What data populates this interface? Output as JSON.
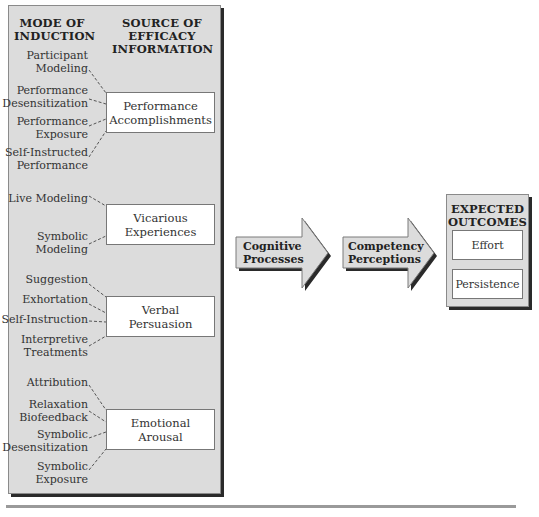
{
  "headers": {
    "mode": [
      "MODE OF",
      "INDUCTION"
    ],
    "source": [
      "SOURCE OF",
      "EFFICACY",
      "INFORMATION"
    ]
  },
  "sources": [
    {
      "label": [
        "Performance",
        "Accomplishments"
      ],
      "modes": [
        [
          "Participant",
          "Modeling"
        ],
        [
          "Performance",
          "Desensitization"
        ],
        [
          "Performance",
          "Exposure"
        ],
        [
          "Self-Instructed",
          "Performance"
        ]
      ]
    },
    {
      "label": [
        "Vicarious",
        "Experiences"
      ],
      "modes": [
        [
          "Live Modeling"
        ],
        [
          "Symbolic",
          "Modeling"
        ]
      ]
    },
    {
      "label": [
        "Verbal",
        "Persuasion"
      ],
      "modes": [
        [
          "Suggestion"
        ],
        [
          "Exhortation"
        ],
        [
          "Self-Instruction"
        ],
        [
          "Interpretive",
          "Treatments"
        ]
      ]
    },
    {
      "label": [
        "Emotional",
        "Arousal"
      ],
      "modes": [
        [
          "Attribution"
        ],
        [
          "Relaxation",
          "Biofeedback"
        ],
        [
          "Symbolic",
          "Desensitization"
        ],
        [
          "Symbolic",
          "Exposure"
        ]
      ]
    }
  ],
  "arrows": [
    {
      "label": [
        "Cognitive",
        "Processes"
      ]
    },
    {
      "label": [
        "Competency",
        "Perceptions"
      ]
    }
  ],
  "outcomes": {
    "title": [
      "EXPECTED",
      "OUTCOMES"
    ],
    "items": [
      "Effort",
      "Persistence"
    ]
  },
  "colors": {
    "panel": "#dcdcdc",
    "box": "#ffffff",
    "shadow": "#2a2a2a"
  }
}
